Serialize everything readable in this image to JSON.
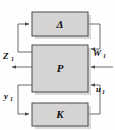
{
  "figure": {
    "kind": "control-block-diagram",
    "background_color": "#fefefe",
    "line_color": "#6b6b6b",
    "block_fill_color": "#d6d4d2",
    "block_border_color": "#4a4a4a",
    "text_color": "#111111"
  },
  "blocks": [
    {
      "id": "delta",
      "label": "Δ",
      "role": "uncertainty-block",
      "x": 32,
      "y": 12,
      "w": 56,
      "h": 24
    },
    {
      "id": "plant",
      "label": "P",
      "role": "plant-block",
      "x": 32,
      "y": 45,
      "w": 56,
      "h": 47
    },
    {
      "id": "controller",
      "label": "K",
      "role": "controller-block",
      "x": 32,
      "y": 103,
      "w": 56,
      "h": 23
    }
  ],
  "signals": [
    {
      "id": "z1",
      "base": "Z",
      "subscript": "1",
      "display": "Z₁",
      "side": "left",
      "direction": "out",
      "label_x": 3,
      "label_y": 56
    },
    {
      "id": "y1",
      "base": "y",
      "subscript": "1",
      "display": "y₁",
      "side": "left",
      "direction": "out",
      "label_x": 4,
      "label_y": 97
    },
    {
      "id": "w1",
      "base": "W",
      "subscript": "1",
      "display": "W₁",
      "side": "right",
      "direction": "in",
      "label_x": 93,
      "label_y": 53
    },
    {
      "id": "u1",
      "base": "u",
      "subscript": "1",
      "display": "u₁",
      "side": "right",
      "direction": "in",
      "label_x": 95,
      "label_y": 89
    }
  ],
  "connections": [
    {
      "id": "plant-to-delta",
      "from": "plant-left-upper",
      "to": "delta-left-input",
      "path": "feedback-up-left"
    },
    {
      "id": "delta-to-plant",
      "from": "delta-right-output",
      "to": "plant-right-upper-input",
      "path": "feed-down-right"
    },
    {
      "id": "plant-to-controller",
      "from": "plant-left-lower",
      "to": "controller-left-input",
      "path": "feedback-down-left"
    },
    {
      "id": "controller-to-plant",
      "from": "controller-right-output",
      "to": "plant-right-lower-input",
      "path": "feed-up-right"
    },
    {
      "id": "z1-out",
      "from": "plant-left-middle",
      "to": "z1-terminal",
      "path": "straight-left"
    },
    {
      "id": "w1-in",
      "from": "w1-terminal",
      "to": "plant-right-middle-input",
      "path": "straight-left"
    }
  ]
}
